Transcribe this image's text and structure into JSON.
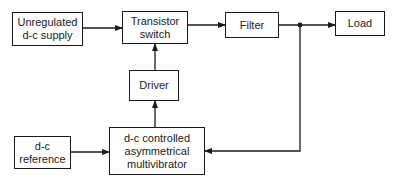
{
  "diagram": {
    "type": "block-diagram",
    "blocks": {
      "unregulated_supply": {
        "label": "Unregulated\nd-c supply"
      },
      "transistor_switch": {
        "label": "Transistor\nswitch"
      },
      "filter": {
        "label": "Filter"
      },
      "load": {
        "label": "Load"
      },
      "driver": {
        "label": "Driver"
      },
      "dc_reference": {
        "label": "d-c\nreference"
      },
      "multivibrator": {
        "label": "d-c controlled\nasymmetrical\nmultivibrator"
      }
    },
    "connections": [
      {
        "from": "Unregulated d-c supply",
        "to": "Transistor switch"
      },
      {
        "from": "Transistor switch",
        "to": "Filter"
      },
      {
        "from": "Filter",
        "to": "Load"
      },
      {
        "from": "Filter output junction",
        "to": "d-c controlled asymmetrical multivibrator"
      },
      {
        "from": "d-c reference",
        "to": "d-c controlled asymmetrical multivibrator"
      },
      {
        "from": "d-c controlled asymmetrical multivibrator",
        "to": "Driver"
      },
      {
        "from": "Driver",
        "to": "Transistor switch"
      }
    ],
    "colors": {
      "line": "#1a1a1a",
      "background": "#ffffff"
    }
  }
}
